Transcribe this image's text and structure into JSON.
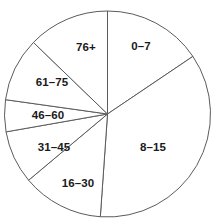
{
  "chart_data": {
    "type": "pie",
    "title": "",
    "subtitle": "",
    "xlabel": "",
    "ylabel": "",
    "grid": false,
    "legend": "none",
    "label_position": "inside-slice",
    "start_angle_deg": 0,
    "direction": "clockwise",
    "center_px": [
      107.5,
      114
    ],
    "radius_px": 103,
    "stroke_color": "#5b5b5b",
    "fill_color": "#ffffff",
    "label_color": "#1a1a1a",
    "categories": [
      "0–7",
      "8–15",
      "16–30",
      "31–45",
      "46–60",
      "61–75",
      "76+"
    ],
    "values": [
      56,
      128,
      46,
      30,
      18,
      36,
      46
    ],
    "unit": "degrees",
    "slices": [
      {
        "label": "0–7",
        "start_deg": 0,
        "end_deg": 56,
        "sweep_deg": 56,
        "percent": 15.6,
        "label_x": 141,
        "label_y": 46
      },
      {
        "label": "8–15",
        "start_deg": 56,
        "end_deg": 184,
        "sweep_deg": 128,
        "percent": 35.6,
        "label_x": 153,
        "label_y": 147
      },
      {
        "label": "16–30",
        "start_deg": 184,
        "end_deg": 230,
        "sweep_deg": 46,
        "percent": 12.8,
        "label_x": 78,
        "label_y": 183
      },
      {
        "label": "31–45",
        "start_deg": 230,
        "end_deg": 260,
        "sweep_deg": 30,
        "percent": 8.3,
        "label_x": 54,
        "label_y": 147
      },
      {
        "label": "46–60",
        "start_deg": 260,
        "end_deg": 278,
        "sweep_deg": 18,
        "percent": 5.0,
        "label_x": 48,
        "label_y": 115
      },
      {
        "label": "61–75",
        "start_deg": 278,
        "end_deg": 314,
        "sweep_deg": 36,
        "percent": 10.0,
        "label_x": 52,
        "label_y": 82
      },
      {
        "label": "76+",
        "start_deg": 314,
        "end_deg": 360,
        "sweep_deg": 46,
        "percent": 12.8,
        "label_x": 86,
        "label_y": 47
      }
    ]
  }
}
